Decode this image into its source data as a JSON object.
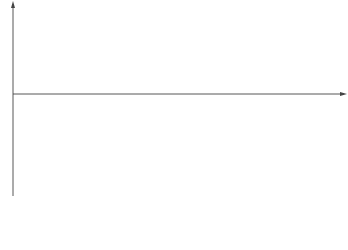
{
  "diagram": {
    "axis_labels": {
      "y": "e",
      "x": "t",
      "origin": "O"
    },
    "amplitude_label": "E",
    "amplitude_subscript": "m",
    "phase_spacing_label": {
      "num": "T",
      "den": "3"
    },
    "period_label": "T",
    "curve_labels": [
      {
        "main": "E",
        "sub": "1"
      },
      {
        "main": "E",
        "sub": "2"
      },
      {
        "main": "E",
        "sub": "3"
      }
    ],
    "caption": "图2.9　三相交流电波形"
  },
  "chart_data": {
    "type": "line",
    "xlabel": "t",
    "ylabel": "e",
    "period": "T",
    "phase_shift": "T/3",
    "series": [
      {
        "name": "E1",
        "expression": "Em·sin(ωt)"
      },
      {
        "name": "E2",
        "expression": "Em·sin(ωt − 120°)"
      },
      {
        "name": "E3",
        "expression": "Em·sin(ωt − 240°)"
      }
    ],
    "x_range_periods": [
      0,
      1.85
    ],
    "annotations": [
      "Em",
      "T/3",
      "T/3",
      "T/3",
      "T",
      "T",
      "T"
    ]
  }
}
